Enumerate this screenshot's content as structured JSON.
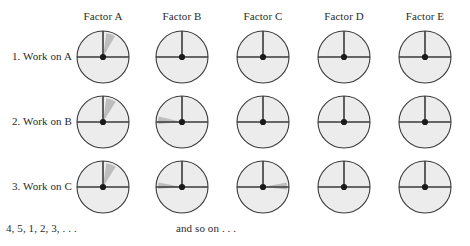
{
  "figure": {
    "title_text": "",
    "background_color": "#ffffff",
    "ink_color": "#2b2b2b",
    "dial_fill_color": "#ececec",
    "dial_stroke_color": "#3a3a3a",
    "wedge_color": "#bdbdbd",
    "hub_color": "#1a1a1a"
  },
  "columns": [
    {
      "id": "factor-a",
      "label": "Factor A",
      "cx": 103
    },
    {
      "id": "factor-b",
      "label": "Factor B",
      "cx": 182
    },
    {
      "id": "factor-c",
      "label": "Factor C",
      "cx": 263
    },
    {
      "id": "factor-d",
      "label": "Factor D",
      "cx": 344
    },
    {
      "id": "factor-e",
      "label": "Factor E",
      "cx": 425
    }
  ],
  "header": {
    "y": 17
  },
  "rows": [
    {
      "id": "row-1",
      "label": "1. Work on A",
      "cy": 57,
      "label_right": 72
    },
    {
      "id": "row-2",
      "label": "2. Work on B",
      "cy": 122,
      "label_right": 72
    },
    {
      "id": "row-3",
      "label": "3. Work on C",
      "cy": 187,
      "label_right": 72
    }
  ],
  "dial": {
    "radius": 26,
    "hub_radius": 3.1,
    "wedge_radius": 24,
    "vertical_tick_label": "12-oclock-marker",
    "horizontal_line_label": "horizon-line"
  },
  "clocks": [
    {
      "row": 0,
      "col": 0,
      "name": "dial-row1-factor-a",
      "has_wedge": true,
      "wedge_start_deg": 8,
      "wedge_end_deg": 30
    },
    {
      "row": 0,
      "col": 1,
      "name": "dial-row1-factor-b",
      "has_wedge": false,
      "wedge_start_deg": 0,
      "wedge_end_deg": 0
    },
    {
      "row": 0,
      "col": 2,
      "name": "dial-row1-factor-c",
      "has_wedge": false,
      "wedge_start_deg": 0,
      "wedge_end_deg": 0
    },
    {
      "row": 0,
      "col": 3,
      "name": "dial-row1-factor-d",
      "has_wedge": false,
      "wedge_start_deg": 0,
      "wedge_end_deg": 0
    },
    {
      "row": 0,
      "col": 4,
      "name": "dial-row1-factor-e",
      "has_wedge": false,
      "wedge_start_deg": 0,
      "wedge_end_deg": 0
    },
    {
      "row": 1,
      "col": 0,
      "name": "dial-row2-factor-a",
      "has_wedge": true,
      "wedge_start_deg": 8,
      "wedge_end_deg": 32
    },
    {
      "row": 1,
      "col": 1,
      "name": "dial-row2-factor-b",
      "has_wedge": true,
      "wedge_start_deg": 265,
      "wedge_end_deg": 283
    },
    {
      "row": 1,
      "col": 2,
      "name": "dial-row2-factor-c",
      "has_wedge": false,
      "wedge_start_deg": 0,
      "wedge_end_deg": 0
    },
    {
      "row": 1,
      "col": 3,
      "name": "dial-row2-factor-d",
      "has_wedge": false,
      "wedge_start_deg": 0,
      "wedge_end_deg": 0
    },
    {
      "row": 1,
      "col": 4,
      "name": "dial-row2-factor-e",
      "has_wedge": false,
      "wedge_start_deg": 0,
      "wedge_end_deg": 0
    },
    {
      "row": 2,
      "col": 0,
      "name": "dial-row3-factor-a",
      "has_wedge": true,
      "wedge_start_deg": 8,
      "wedge_end_deg": 32
    },
    {
      "row": 2,
      "col": 1,
      "name": "dial-row3-factor-b",
      "has_wedge": true,
      "wedge_start_deg": 266,
      "wedge_end_deg": 281
    },
    {
      "row": 2,
      "col": 2,
      "name": "dial-row3-factor-c",
      "has_wedge": true,
      "wedge_start_deg": 79,
      "wedge_end_deg": 96
    },
    {
      "row": 2,
      "col": 3,
      "name": "dial-row3-factor-d",
      "has_wedge": false,
      "wedge_start_deg": 0,
      "wedge_end_deg": 0
    },
    {
      "row": 2,
      "col": 4,
      "name": "dial-row3-factor-e",
      "has_wedge": false,
      "wedge_start_deg": 0,
      "wedge_end_deg": 0
    }
  ],
  "footer": {
    "sequence_note": "4, 5, 1, 2, 3, . . .",
    "sequence_x": 6,
    "sequence_y": 222,
    "continuation_note": "and so on . . .",
    "continuation_x": 176,
    "continuation_y": 222
  }
}
